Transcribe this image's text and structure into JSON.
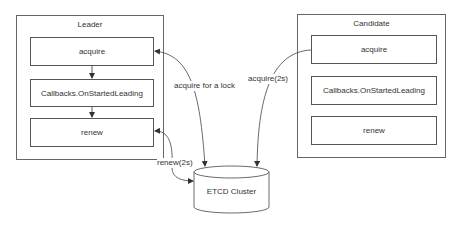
{
  "leader": {
    "title": "Leader",
    "steps": [
      "acquire",
      "Callbacks.OnStartedLeading",
      "renew"
    ]
  },
  "candidate": {
    "title": "Candidate",
    "steps": [
      "acquire",
      "Callbacks.OnStartedLeading",
      "renew"
    ]
  },
  "store": {
    "label": "ETCD Cluster"
  },
  "edges": {
    "leader_acquire": "acquire for a lock",
    "leader_renew": "renew(2s)",
    "candidate_acquire": "acquire(2s)"
  },
  "colors": {
    "stroke": "#555555",
    "background": "#ffffff"
  }
}
